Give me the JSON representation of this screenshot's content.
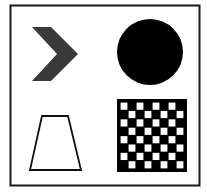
{
  "figure": {
    "background": "#ffffff",
    "frame_color": "#1a1a1a",
    "shapes": [
      {
        "id": "chevron",
        "kind": "chevron",
        "position": "top-left",
        "fill": "#3a3a3a"
      },
      {
        "id": "circle",
        "kind": "circle",
        "position": "top-right",
        "fill": "#000000"
      },
      {
        "id": "trapezoid",
        "kind": "trapezoid",
        "position": "bottom-left",
        "fill": "none",
        "stroke": "#111111"
      },
      {
        "id": "checkerboard",
        "kind": "checkerboard",
        "position": "bottom-right",
        "rows": 8,
        "cols": 8,
        "dark": "#000000",
        "light": "#ffffff"
      }
    ]
  }
}
